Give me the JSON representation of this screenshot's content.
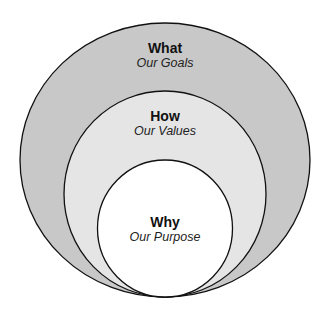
{
  "diagram": {
    "type": "nested-circles",
    "colors": {
      "outer": "#c8c8c8",
      "middle": "#e5e5e5",
      "inner": "#ffffff",
      "stroke": "#111111"
    },
    "rings": [
      {
        "title": "What",
        "subtitle": "Our Goals"
      },
      {
        "title": "How",
        "subtitle": "Our Values"
      },
      {
        "title": "Why",
        "subtitle": "Our Purpose"
      }
    ]
  }
}
